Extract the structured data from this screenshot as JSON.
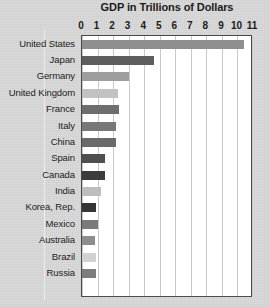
{
  "chart_data": {
    "type": "bar",
    "orientation": "horizontal",
    "title": "GDP in Trillions of Dollars",
    "xlabel": "",
    "ylabel": "",
    "xlim": [
      0,
      11
    ],
    "grid": true,
    "legend": "none",
    "tick_labels": [
      "0",
      "1",
      "2",
      "3",
      "4",
      "5",
      "6",
      "7",
      "8",
      "9",
      "10",
      "11"
    ],
    "tick_values": [
      0,
      1,
      2,
      3,
      4,
      5,
      6,
      7,
      8,
      9,
      10,
      11
    ],
    "categories": [
      "United States",
      "Japan",
      "Germany",
      "United Kingdom",
      "France",
      "Italy",
      "China",
      "Spain",
      "Canada",
      "India",
      "Korea, Rep.",
      "Mexico",
      "Australia",
      "Brazil",
      "Russia"
    ],
    "values": [
      10.4,
      4.6,
      3.0,
      2.3,
      2.4,
      2.2,
      2.2,
      1.5,
      1.5,
      1.2,
      0.9,
      1.0,
      0.85,
      0.9,
      0.9
    ],
    "bar_colors": [
      "#8f8f8f",
      "#5e5e5e",
      "#9e9e9e",
      "#c2c2c2",
      "#6e6e6e",
      "#787878",
      "#6a6a6a",
      "#4f4f4f",
      "#3c3c3c",
      "#bdbdbd",
      "#353535",
      "#7a7a7a",
      "#8d8d8d",
      "#d2d2d2",
      "#7e7e7e"
    ]
  },
  "colors": {
    "page_background": "#d9d9d9",
    "plot_background": "#ffffff",
    "plot_border": "#4a4a4a",
    "gridline": "#c9c9c9",
    "text": "#1b1b1b"
  }
}
